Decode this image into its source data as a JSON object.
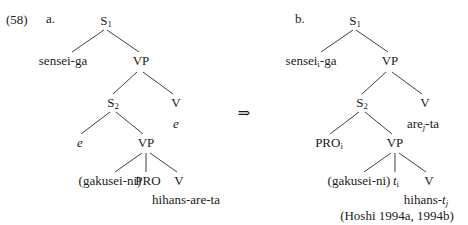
{
  "figure": {
    "example_number": "(58)",
    "transform_arrow": "⇒",
    "citation": "(Hoshi 1994a, 1994b)"
  },
  "tree_a": {
    "label": "a.",
    "nodes": {
      "s1": "S",
      "s1_sub": "1",
      "subject": "sensei-ga",
      "vp1": "VP",
      "s2": "S",
      "s2_sub": "2",
      "v_matrix": "V",
      "v_matrix_word": "e",
      "empty_subject": "e",
      "vp2": "VP",
      "dative": "(gakusei-ni)",
      "pro": "PRO",
      "v_embedded": "V",
      "v_embedded_word": "hihans-are-ta"
    }
  },
  "tree_b": {
    "label": "b.",
    "nodes": {
      "s1": "S",
      "s1_sub": "1",
      "subject_stem": "sensei",
      "subject_index": "i",
      "subject_suffix": "-ga",
      "vp1": "VP",
      "s2": "S",
      "s2_sub": "2",
      "v_matrix": "V",
      "v_matrix_stem": "are",
      "v_matrix_index": "j",
      "v_matrix_suffix": "-ta",
      "pro": "PRO",
      "pro_index": "i",
      "vp2": "VP",
      "dative": "(gakusei-ni)",
      "trace": "t",
      "trace_index": "i",
      "v_embedded": "V",
      "v_embedded_stem": "hihans-",
      "v_embedded_trace": "t",
      "v_embedded_index": "j"
    }
  }
}
